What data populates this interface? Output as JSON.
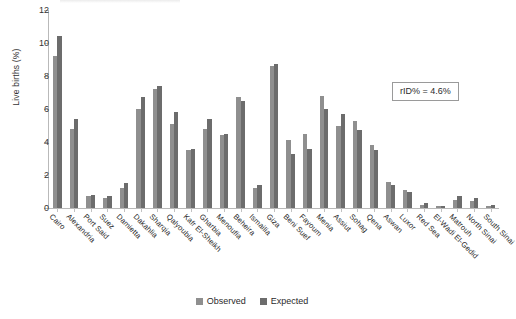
{
  "chart_data": {
    "type": "bar",
    "title": "",
    "xlabel": "",
    "ylabel": "Live births (%)",
    "ylim": [
      0,
      12
    ],
    "yticks": [
      0,
      2,
      4,
      6,
      8,
      10,
      12
    ],
    "grid": false,
    "legend_position": "bottom-center",
    "categories": [
      "Cairo",
      "Alexandria",
      "Port Said",
      "Suez",
      "Damietta",
      "Dakahlia",
      "Sharqia",
      "Qalyoubia",
      "Kafr El-Sheikh",
      "Gharbia",
      "Menoufia",
      "Beheira",
      "Ismailia",
      "Giza",
      "Beni Suef",
      "Fayoum",
      "Menia",
      "Assiut",
      "Sohag",
      "Qena",
      "Aswan",
      "Luxor",
      "Red Sea",
      "El-Wadi El-Gedid",
      "Matrouh",
      "North Sinai",
      "South Sinai"
    ],
    "series": [
      {
        "name": "Observed",
        "color": "#8f8f8f",
        "values": [
          9.2,
          4.8,
          0.7,
          0.6,
          1.2,
          6.0,
          7.2,
          5.1,
          3.5,
          4.8,
          4.4,
          6.7,
          1.2,
          8.6,
          4.1,
          4.5,
          6.8,
          5.0,
          5.3,
          3.8,
          1.6,
          1.1,
          0.2,
          0.1,
          0.5,
          0.4,
          0.1
        ]
      },
      {
        "name": "Expected",
        "color": "#6c6c6c",
        "values": [
          10.4,
          5.4,
          0.8,
          0.7,
          1.5,
          6.7,
          7.4,
          5.8,
          3.6,
          5.4,
          4.5,
          6.5,
          1.4,
          8.7,
          3.3,
          3.6,
          6.0,
          5.7,
          4.7,
          3.5,
          1.4,
          1.0,
          0.3,
          0.15,
          0.7,
          0.6,
          0.2
        ]
      }
    ],
    "annotations": [
      {
        "text": "rID% = 4.6%",
        "position": "top-right"
      }
    ]
  }
}
